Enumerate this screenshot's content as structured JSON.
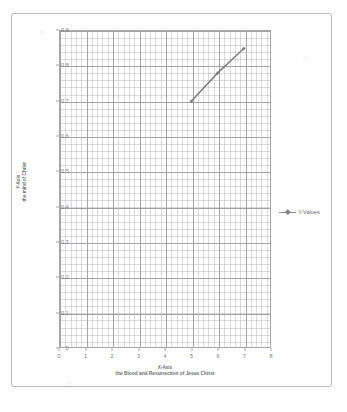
{
  "chart_data": {
    "type": "line",
    "title": "",
    "xlabel": "X-Axis\nthe Blood and Resurrection of Jesus Christ",
    "xlabel_line1": "X-Axis",
    "xlabel_line2": "the Blood and Resurrection of Jesus Christ",
    "ylabel": "Y-Axis\nthe mind of Christ",
    "ylabel_line1": "Y-Axis",
    "ylabel_line2": "the mind of Christ",
    "xlim": [
      0,
      8
    ],
    "ylim": [
      0,
      0.9
    ],
    "grid": true,
    "minor_grid": true,
    "legend_position": "right",
    "xticks": [
      "0",
      "1",
      "2",
      "3",
      "4",
      "5",
      "6",
      "7",
      "8"
    ],
    "xtick_values": [
      0,
      1,
      2,
      3,
      4,
      5,
      6,
      7,
      8
    ],
    "yticks": [
      "0",
      "0.1",
      "0.2",
      "0.3",
      "0.4",
      "0.5",
      "0.6",
      "0.7",
      "0.8",
      "0.9"
    ],
    "ytick_values": [
      0,
      0.1,
      0.2,
      0.3,
      0.4,
      0.5,
      0.6,
      0.7,
      0.8,
      0.9
    ],
    "series": [
      {
        "name": "Y-Values",
        "color": "#7e7e7e",
        "marker": "diamond",
        "x": [
          5,
          6,
          7
        ],
        "values": [
          0.7,
          0.78,
          0.85
        ]
      }
    ]
  },
  "legend": {
    "entries": [
      {
        "label": "Y-Values"
      }
    ]
  },
  "colors": {
    "series": "#7e7e7e",
    "grid_major": "#7d7d84",
    "grid_minor": "#aaaaaf",
    "axis": "#a8a8a8",
    "text": "#6e6e6e",
    "page_border": "#b9b9b9"
  }
}
